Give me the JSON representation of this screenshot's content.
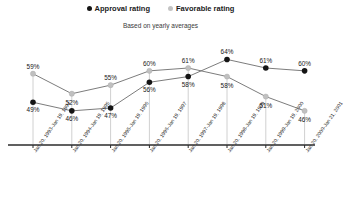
{
  "legend": {
    "items": [
      {
        "label": "Approval rating",
        "color": "#151515",
        "icon": "filled-circle-icon"
      },
      {
        "label": "Favorable rating",
        "color": "#c3c3c3",
        "icon": "filled-circle-icon"
      }
    ]
  },
  "subtitle": "Based on yearly averages",
  "chart_data": {
    "type": "line",
    "title": "",
    "subtitle": "Based on yearly averages",
    "xlabel": "",
    "ylabel": "",
    "ylim": [
      40,
      68
    ],
    "grid": false,
    "legend_position": "top-center",
    "categories": [
      "Jan 20, 1993-Jan 19, 1994",
      "Jan 20, 1994-Jan 19, 1995",
      "Jan 20, 1995-Jan 19, 1996",
      "Jan 20, 1996-Jan 19, 1997",
      "Jan 20, 1997-Jan 19, 1998",
      "Jan 20, 1998-Jan 19, 1999",
      "Jan 20, 1999-Jan 19, 2000",
      "Jan 20, 2000-Jan 21, 2001"
    ],
    "series": [
      {
        "name": "Approval rating",
        "color": "#151515",
        "values": [
          49,
          46,
          47,
          56,
          58,
          64,
          61,
          60
        ],
        "labels": [
          "49%",
          "46%",
          "47%",
          "56%",
          "58%",
          "64%",
          "61%",
          "60%"
        ]
      },
      {
        "name": "Favorable rating",
        "color": "#c3c3c3",
        "values": [
          59,
          52,
          55,
          60,
          61,
          58,
          51,
          46
        ],
        "labels": [
          "59%",
          "52%",
          "55%",
          "60%",
          "61%",
          "58%",
          "51%",
          "46%"
        ]
      }
    ]
  }
}
